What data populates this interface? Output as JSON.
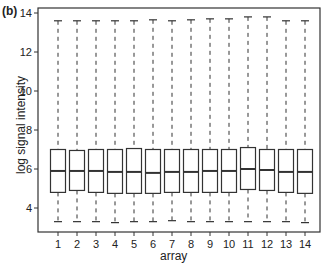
{
  "panel_label": "(b)",
  "chart_data": {
    "type": "box",
    "title": "",
    "xlabel": "array",
    "ylabel": "log signal intensity",
    "categories": [
      "1",
      "2",
      "3",
      "4",
      "5",
      "6",
      "7",
      "8",
      "9",
      "10",
      "11",
      "12",
      "13",
      "14"
    ],
    "ylim": [
      2.8,
      14.2
    ],
    "yticks": [
      4,
      6,
      8,
      10,
      12,
      14
    ],
    "grid": false,
    "legend": null,
    "boxes": [
      {
        "label": "1",
        "whisker_low": 3.3,
        "q1": 4.8,
        "median": 5.9,
        "q3": 7.0,
        "whisker_high": 13.6
      },
      {
        "label": "2",
        "whisker_low": 3.3,
        "q1": 4.9,
        "median": 5.9,
        "q3": 6.95,
        "whisker_high": 13.6
      },
      {
        "label": "3",
        "whisker_low": 3.3,
        "q1": 4.8,
        "median": 5.9,
        "q3": 7.0,
        "whisker_high": 13.6
      },
      {
        "label": "4",
        "whisker_low": 3.25,
        "q1": 4.75,
        "median": 5.85,
        "q3": 7.0,
        "whisker_high": 13.6
      },
      {
        "label": "5",
        "whisker_low": 3.3,
        "q1": 4.75,
        "median": 5.85,
        "q3": 7.05,
        "whisker_high": 13.6
      },
      {
        "label": "6",
        "whisker_low": 3.3,
        "q1": 4.75,
        "median": 5.8,
        "q3": 7.0,
        "whisker_high": 13.65
      },
      {
        "label": "7",
        "whisker_low": 3.35,
        "q1": 4.8,
        "median": 5.85,
        "q3": 7.0,
        "whisker_high": 13.6
      },
      {
        "label": "8",
        "whisker_low": 3.3,
        "q1": 4.8,
        "median": 5.85,
        "q3": 7.0,
        "whisker_high": 13.65
      },
      {
        "label": "9",
        "whisker_low": 3.3,
        "q1": 4.8,
        "median": 5.9,
        "q3": 7.0,
        "whisker_high": 13.7
      },
      {
        "label": "10",
        "whisker_low": 3.3,
        "q1": 4.8,
        "median": 5.9,
        "q3": 7.0,
        "whisker_high": 13.7
      },
      {
        "label": "11",
        "whisker_low": 3.3,
        "q1": 4.95,
        "median": 6.0,
        "q3": 7.1,
        "whisker_high": 13.8
      },
      {
        "label": "12",
        "whisker_low": 3.3,
        "q1": 4.9,
        "median": 5.95,
        "q3": 7.0,
        "whisker_high": 13.8
      },
      {
        "label": "13",
        "whisker_low": 3.3,
        "q1": 4.8,
        "median": 5.85,
        "q3": 7.0,
        "whisker_high": 13.6
      },
      {
        "label": "14",
        "whisker_low": 3.25,
        "q1": 4.75,
        "median": 5.85,
        "q3": 7.0,
        "whisker_high": 13.6
      }
    ]
  },
  "style": {
    "line_color": "#333333",
    "box_fill": "#ffffff"
  }
}
